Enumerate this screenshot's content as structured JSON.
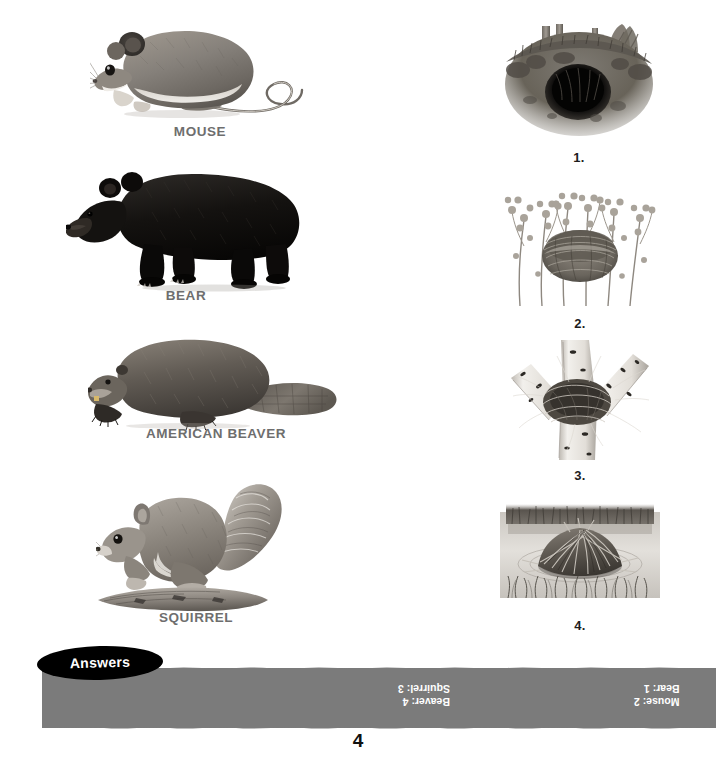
{
  "page": {
    "background_color": "#ffffff",
    "page_number": "4",
    "width": 716,
    "height": 757
  },
  "animals": [
    {
      "label": "MOUSE",
      "icon": "mouse-illustration",
      "x": 90,
      "y": 18,
      "w": 220,
      "h": 105,
      "label_y": 124
    },
    {
      "label": "BEAR",
      "icon": "black-bear-illustration",
      "x": 66,
      "y": 168,
      "w": 240,
      "h": 122,
      "label_y": 290
    },
    {
      "label": "AMERICAN BEAVER",
      "icon": "american-beaver-illustration",
      "x": 88,
      "y": 336,
      "w": 256,
      "h": 90,
      "label_y": 432
    },
    {
      "label": "SQUIRREL",
      "icon": "squirrel-illustration",
      "x": 96,
      "y": 482,
      "w": 200,
      "h": 128,
      "label_y": 622
    }
  ],
  "habitats": [
    {
      "number": "1.",
      "icon": "bear-den-burrow-illustration",
      "x": 500,
      "y": 22,
      "w": 158,
      "h": 118,
      "number_y": 150
    },
    {
      "number": "2.",
      "icon": "mouse-nest-in-grass-illustration",
      "x": 502,
      "y": 186,
      "w": 156,
      "h": 122,
      "number_y": 316
    },
    {
      "number": "3.",
      "icon": "squirrel-drey-in-birch-illustration",
      "x": 505,
      "y": 338,
      "w": 150,
      "h": 122,
      "number_y": 468
    },
    {
      "number": "4.",
      "icon": "beaver-lodge-in-pond-illustration",
      "x": 500,
      "y": 492,
      "w": 160,
      "h": 120,
      "number_y": 622
    }
  ],
  "answers": {
    "tab_label": "Answers",
    "strip_color": "#7b7b7b",
    "text_color": "#ffffff",
    "columns": [
      {
        "x": 398,
        "lines": [
          "Beaver: 4",
          "Squirrel: 3"
        ]
      },
      {
        "x": 634,
        "lines": [
          "Mouse: 2",
          "Bear: 1"
        ]
      }
    ]
  },
  "colors": {
    "label_gray": "#6e6e6e",
    "number_black": "#1d1d1d",
    "strip_gray": "#7b7b7b",
    "tab_black": "#000000"
  }
}
